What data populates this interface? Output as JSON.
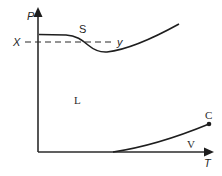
{
  "diagram": {
    "type": "phase-diagram",
    "axes": {
      "y_label": "P",
      "x_label": "T"
    },
    "regions": {
      "solid": "S",
      "liquid": "L",
      "vapor": "V"
    },
    "points": {
      "critical": "C"
    },
    "isobar": {
      "start_label": "X",
      "end_label": "y"
    },
    "colors": {
      "line": "#1e1e1e",
      "background": "#ffffff"
    }
  }
}
